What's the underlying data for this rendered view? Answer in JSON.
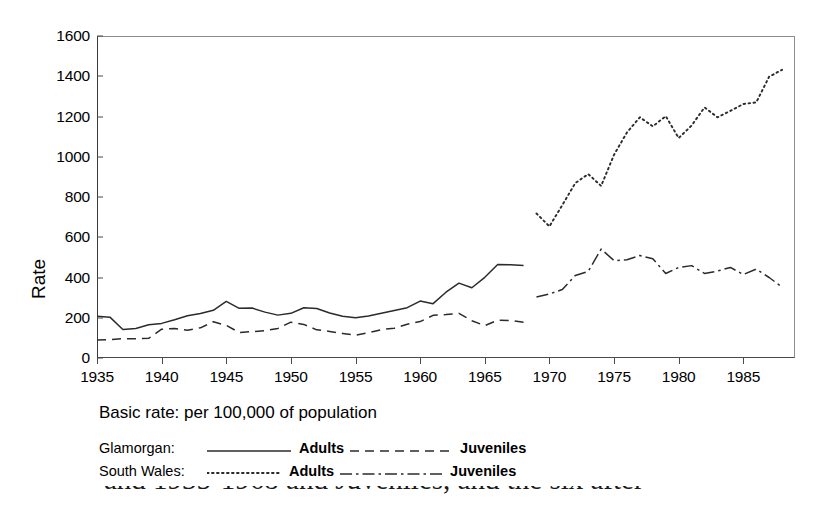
{
  "figure": {
    "ylabel": "Rate",
    "caption": "Basic rate: per 100,000 of population",
    "cropped_caption_below": "and 1935-1968 and Juveniles, and the six after"
  },
  "legend": {
    "rows": [
      {
        "name": "Glamorgan:",
        "adults_label": "Adults",
        "adults_style": "solid",
        "juveniles_label": "Juveniles",
        "juveniles_style": "dashed"
      },
      {
        "name": "South Wales:",
        "adults_label": "Adults",
        "adults_style": "dotted",
        "juveniles_label": "Juveniles",
        "juveniles_style": "dashdot"
      }
    ]
  },
  "chart_data": {
    "type": "line",
    "title": "",
    "subtitle": "",
    "xlabel": "",
    "ylabel": "Rate",
    "xlim": [
      1935,
      1989
    ],
    "ylim": [
      0,
      1600
    ],
    "yticks": [
      0,
      200,
      400,
      600,
      800,
      1000,
      1200,
      1400,
      1600
    ],
    "xticks": [
      1935,
      1940,
      1945,
      1950,
      1955,
      1960,
      1965,
      1970,
      1975,
      1980,
      1985
    ],
    "grid": false,
    "legend_position": "below-plot",
    "annotation": "Basic rate: per 100,000 of population",
    "series": [
      {
        "name": "Glamorgan: Adults",
        "style": "solid",
        "x": [
          1935,
          1936,
          1937,
          1938,
          1939,
          1940,
          1941,
          1942,
          1943,
          1944,
          1945,
          1946,
          1947,
          1948,
          1949,
          1950,
          1951,
          1952,
          1953,
          1954,
          1955,
          1956,
          1957,
          1958,
          1959,
          1960,
          1961,
          1962,
          1963,
          1964,
          1965,
          1966,
          1967,
          1968
        ],
        "values": [
          207,
          203,
          142,
          147,
          165,
          172,
          190,
          210,
          221,
          237,
          281,
          247,
          248,
          228,
          213,
          222,
          250,
          246,
          224,
          207,
          200,
          209,
          222,
          236,
          250,
          283,
          270,
          327,
          372,
          349,
          401,
          465,
          463,
          460
        ]
      },
      {
        "name": "Glamorgan: Juveniles",
        "style": "dashed",
        "x": [
          1935,
          1936,
          1937,
          1938,
          1939,
          1940,
          1941,
          1942,
          1943,
          1944,
          1945,
          1946,
          1947,
          1948,
          1949,
          1950,
          1951,
          1952,
          1953,
          1954,
          1955,
          1956,
          1957,
          1958,
          1959,
          1960,
          1961,
          1962,
          1963,
          1964,
          1965,
          1966,
          1967,
          1968
        ],
        "values": [
          89,
          91,
          96,
          96,
          98,
          143,
          147,
          138,
          150,
          180,
          162,
          127,
          131,
          136,
          147,
          178,
          167,
          140,
          132,
          122,
          113,
          126,
          141,
          148,
          168,
          181,
          212,
          216,
          222,
          185,
          161,
          188,
          186,
          178
        ]
      },
      {
        "name": "South Wales: Adults",
        "style": "dotted",
        "x": [
          1969,
          1970,
          1971,
          1972,
          1973,
          1974,
          1975,
          1976,
          1977,
          1978,
          1979,
          1980,
          1981,
          1982,
          1983,
          1984,
          1985,
          1986,
          1987,
          1988
        ],
        "values": [
          718,
          654,
          760,
          869,
          914,
          855,
          1010,
          1121,
          1196,
          1151,
          1202,
          1093,
          1155,
          1245,
          1196,
          1228,
          1262,
          1270,
          1398,
          1432
        ]
      },
      {
        "name": "South Wales: Juveniles",
        "style": "dashdot",
        "x": [
          1969,
          1970,
          1971,
          1972,
          1973,
          1974,
          1975,
          1976,
          1977,
          1978,
          1979,
          1980,
          1981,
          1982,
          1983,
          1984,
          1985,
          1986,
          1987,
          1988
        ],
        "values": [
          303,
          318,
          340,
          410,
          430,
          541,
          484,
          488,
          509,
          493,
          420,
          450,
          459,
          420,
          432,
          450,
          415,
          442,
          400,
          352
        ]
      }
    ]
  }
}
